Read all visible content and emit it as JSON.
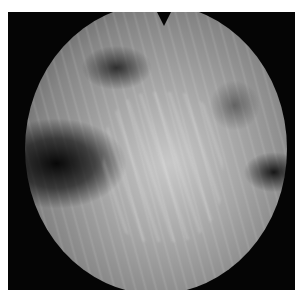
{
  "image": {
    "description": "Grayscale circular endoscopic/microscopic field of view on black background",
    "colors": {
      "background": "#ffffff",
      "frame": "#050505",
      "field_center": "#c8c8c8",
      "field_edge": "#4a4a4a"
    }
  }
}
